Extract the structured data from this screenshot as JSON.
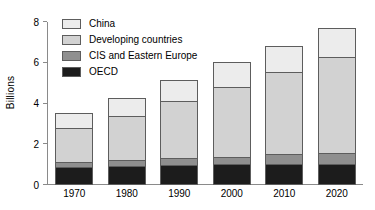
{
  "chart_data": {
    "type": "bar",
    "stacked": true,
    "title": "",
    "xlabel": "",
    "ylabel": "Billions",
    "ylim": [
      0,
      8
    ],
    "yticks": [
      0,
      2,
      4,
      6,
      8
    ],
    "ytick_labels": [
      "0",
      "2",
      "4",
      "6",
      "8"
    ],
    "grid": false,
    "legend_position": "top-left",
    "categories": [
      "1970",
      "1980",
      "1990",
      "2000",
      "2010",
      "2020"
    ],
    "series": [
      {
        "name": "OECD",
        "color": "#1c1c1c",
        "values": [
          0.88,
          0.95,
          0.98,
          1.02,
          1.05,
          1.05
        ]
      },
      {
        "name": "CIS and Eastern Europe",
        "color": "#8f8f8f",
        "values": [
          0.3,
          0.33,
          0.4,
          0.4,
          0.5,
          0.55
        ]
      },
      {
        "name": "Developing countries",
        "color": "#d2d2d2",
        "values": [
          1.72,
          2.22,
          2.82,
          3.48,
          4.1,
          4.8
        ]
      },
      {
        "name": "China",
        "color": "#ececec",
        "values": [
          0.8,
          0.9,
          1.1,
          1.3,
          1.3,
          1.45
        ]
      }
    ],
    "totals": [
      3.7,
      4.4,
      5.3,
      6.2,
      6.95,
      7.85
    ]
  },
  "legend": {
    "items": [
      {
        "label": "China",
        "color": "#ececec"
      },
      {
        "label": "Developing countries",
        "color": "#d2d2d2"
      },
      {
        "label": "CIS and Eastern Europe",
        "color": "#8f8f8f"
      },
      {
        "label": "OECD",
        "color": "#1c1c1c"
      }
    ]
  },
  "axis": {
    "y_title": "Billions"
  }
}
